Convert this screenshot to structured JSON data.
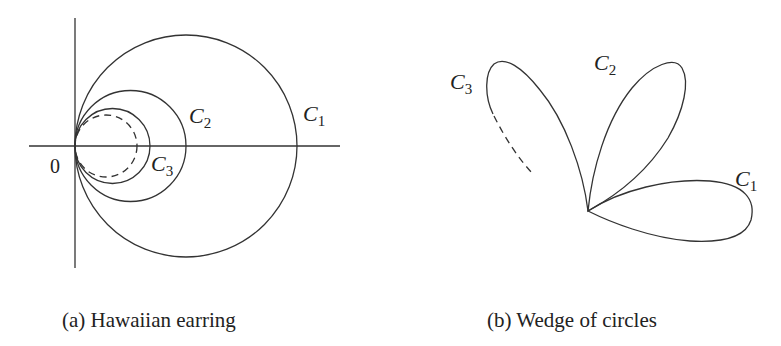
{
  "figure_a": {
    "caption": "(a) Hawaiian earring",
    "origin_label": "0",
    "circles": [
      {
        "name": "C",
        "sub": "1"
      },
      {
        "name": "C",
        "sub": "2"
      },
      {
        "name": "C",
        "sub": "3"
      }
    ],
    "note": "Nested circles tangent at origin, dashed circle indicates further circles"
  },
  "figure_b": {
    "caption": "(b) Wedge of circles",
    "loops": [
      {
        "name": "C",
        "sub": "1"
      },
      {
        "name": "C",
        "sub": "2"
      },
      {
        "name": "C",
        "sub": "3"
      }
    ],
    "note": "Loops joined at a single base point; dashed continuation on C3"
  }
}
